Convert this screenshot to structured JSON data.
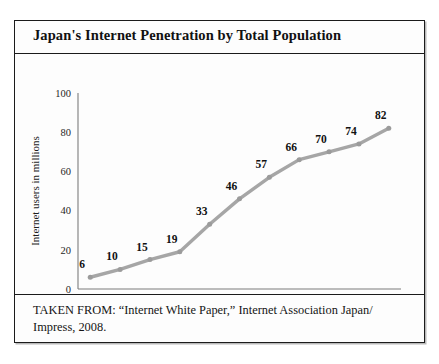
{
  "figure": {
    "title": "Japan's Internet Penetration by Total Population",
    "caption": "TAKEN FROM: “Internet White Paper,” Internet Association Japan/ Impress,  2008."
  },
  "colors": {
    "line": "#a6a6a6",
    "marker": "#9b9b9b",
    "axis": "#7d7d7d",
    "border": "#1b1b1b",
    "text": "#111111",
    "background": "#fdfdfd"
  },
  "chart_data": {
    "type": "line",
    "title": "Japan's Internet Penetration by Total Population",
    "xlabel": "",
    "ylabel": "Internet users in millions",
    "categories": [
      "1997",
      "1998",
      "1999",
      "2000",
      "2001",
      "2002",
      "2003",
      "2004",
      "2005",
      "2006",
      "2007"
    ],
    "values": [
      6,
      10,
      15,
      19,
      33,
      46,
      57,
      66,
      70,
      74,
      82
    ],
    "point_labels": [
      "6",
      "10",
      "15",
      "19",
      "33",
      "46",
      "57",
      "66",
      "70",
      "74",
      "82"
    ],
    "ylim": [
      0,
      100
    ],
    "yticks": [
      0,
      20,
      40,
      60,
      80,
      100
    ],
    "ytick_labels": [
      "0",
      "20",
      "40",
      "60",
      "80",
      "100"
    ],
    "grid": false,
    "legend": false,
    "markers": true,
    "series_name": "Internet users in millions"
  }
}
